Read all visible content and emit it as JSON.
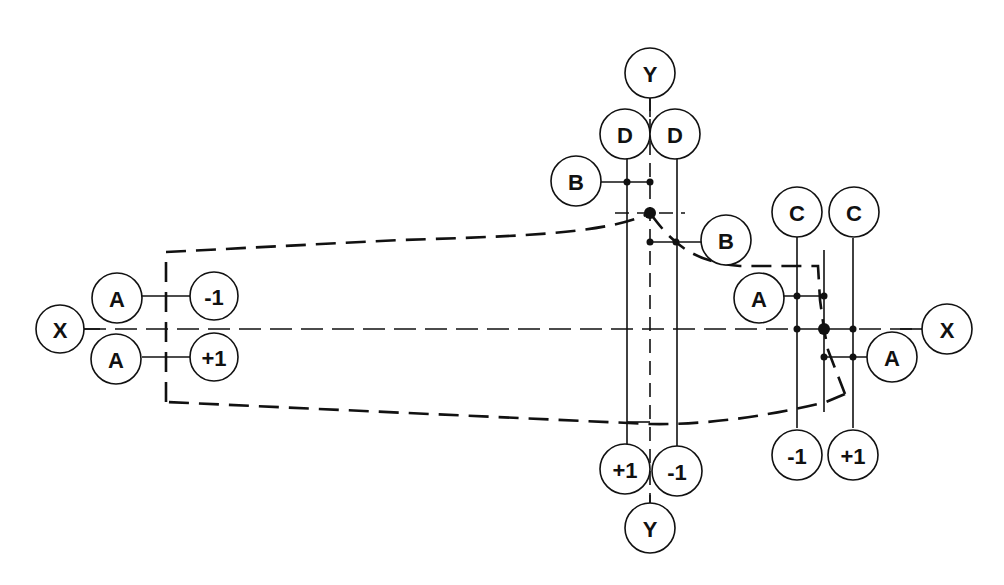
{
  "diagram": {
    "type": "wheel-alignment / part datum reference diagram",
    "colors": {
      "ink": "#111111",
      "background": "#ffffff"
    },
    "axes": {
      "x_axis": {
        "left_label": "X",
        "right_label": "X"
      },
      "y_axis": {
        "top_label": "Y",
        "bottom_label": "Y"
      }
    },
    "left_group": {
      "upper_ref": "A",
      "upper_value": "-1",
      "lower_ref": "A",
      "lower_value": "+1"
    },
    "center_group": {
      "top_left_ref": "D",
      "top_right_ref": "D",
      "left_ref": "B",
      "right_ref": "B",
      "bottom_left_value": "+1",
      "bottom_right_value": "-1"
    },
    "right_group": {
      "top_left_ref": "C",
      "top_right_ref": "C",
      "left_ref": "A",
      "right_ref": "A",
      "bottom_left_value": "-1",
      "bottom_right_value": "+1"
    }
  }
}
